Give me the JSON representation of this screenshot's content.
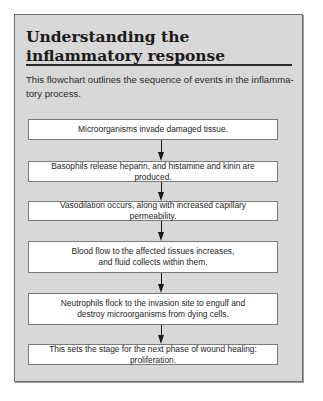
{
  "sidebar_box": {
    "title": "Understanding the inflammatory response",
    "intro": "This flowchart outlines the sequence of events in the inflamma-tory process.",
    "steps": [
      {
        "label": "Microorganisms invade damaged tissue."
      },
      {
        "label": "Basophils release heparin, and histamine and kinin are produced."
      },
      {
        "label": "Vasodilation occurs, along with increased capillary permeability."
      },
      {
        "label": "Blood flow to the affected tissues increases, and fluid collects within them."
      },
      {
        "label": "Neutrophils flock to the invasion site to engulf and destroy microorganisms from dying cells."
      },
      {
        "label": "This sets the stage for the next phase of wound healing: proliferation."
      }
    ],
    "arrow_icon": "down-arrow-icon"
  },
  "colors": {
    "panel_background": "#d8d8d8",
    "panel_border": "#6f6f6f",
    "step_background": "#ffffff",
    "text": "#1e1e1e"
  }
}
